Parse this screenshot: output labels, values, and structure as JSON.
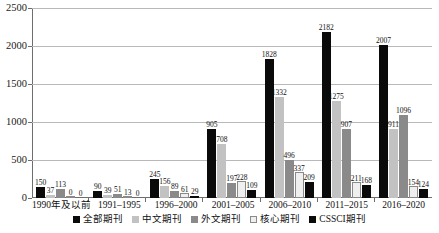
{
  "chart_data": {
    "type": "bar",
    "title": "",
    "xlabel": "",
    "ylabel": "",
    "ylim": [
      0,
      2500
    ],
    "yticks": [
      0,
      500,
      1000,
      1500,
      2000,
      2500
    ],
    "grid": true,
    "legend_position": "bottom",
    "categories": [
      "1990年及以前",
      "1991–1995",
      "1996–2000",
      "2001–2005",
      "2006–2010",
      "2011–2015",
      "2016–2020"
    ],
    "series": [
      {
        "name": "全部期刊",
        "color": "#0a0a0a",
        "values": [
          150,
          90,
          245,
          905,
          1828,
          2182,
          2007
        ]
      },
      {
        "name": "中文期刊",
        "color": "#c2c2c2",
        "values": [
          37,
          39,
          156,
          708,
          1332,
          1275,
          911
        ]
      },
      {
        "name": "外文期刊",
        "color": "#8a8a8a",
        "values": [
          113,
          51,
          89,
          197,
          496,
          907,
          1096
        ]
      },
      {
        "name": "核心期刊",
        "color": "#efefef",
        "values": [
          0,
          13,
          61,
          228,
          337,
          211,
          154
        ]
      },
      {
        "name": "CSSCI期刊",
        "color": "#0a0a0a",
        "values": [
          0,
          0,
          29,
          109,
          209,
          168,
          124
        ]
      }
    ]
  }
}
